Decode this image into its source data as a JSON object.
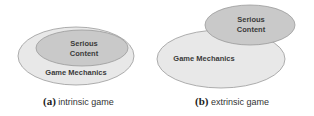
{
  "panels": [
    {
      "id": "a",
      "caption_letter": "(a)",
      "caption_text": "intrinsic game",
      "outer_label": "Game Mechanics",
      "inner_label_line1": "Serious",
      "inner_label_line2": "Content",
      "relation": "serious content contained within game mechanics"
    },
    {
      "id": "b",
      "caption_letter": "(b)",
      "caption_text": "extrinsic game",
      "outer_label": "Game Mechanics",
      "inner_label_line1": "Serious",
      "inner_label_line2": "Content",
      "relation": "serious content overlaps game mechanics partially"
    }
  ],
  "colors": {
    "outer_fill": "#e8e8e8",
    "inner_fill": "#c9c9c9",
    "stroke": "#9a9a9a",
    "text": "#3a3a3a"
  }
}
